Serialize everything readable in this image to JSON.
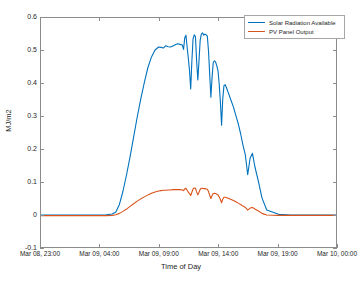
{
  "chart_data": {
    "type": "line",
    "title": "",
    "xlabel": "Time of Day",
    "ylabel": "MJ/m2",
    "grid": false,
    "legend_position": "top-right-inside",
    "ylim": [
      -0.1,
      0.6
    ],
    "yticks": [
      "0.6",
      "0.5",
      "0.4",
      "0.3",
      "0.2",
      "0.1",
      "0",
      "-0.1"
    ],
    "ytick_values": [
      0.6,
      0.5,
      0.4,
      0.3,
      0.2,
      0.1,
      0,
      -0.1
    ],
    "xlim_labels": [
      "Mar 08, 23:00",
      "Mar 10, 00:00"
    ],
    "xticks": [
      "Mar 08, 23:00",
      "Mar 09, 04:00",
      "Mar 09, 09:00",
      "Mar 09, 14:00",
      "Mar 09, 19:00",
      "Mar 10, 00:00"
    ],
    "xtick_hours": [
      0,
      5,
      10,
      15,
      20,
      25
    ],
    "x_hours_range": [
      0,
      25
    ],
    "series": [
      {
        "name": "Solar Radiation Available",
        "color": "#0072BD",
        "x_hours": [
          0,
          1,
          2,
          3,
          4,
          5,
          5.5,
          6,
          6.3,
          6.6,
          6.9,
          7.2,
          7.5,
          7.8,
          8.1,
          8.4,
          8.7,
          9.0,
          9.3,
          9.6,
          9.9,
          10.1,
          10.3,
          10.5,
          10.7,
          10.9,
          11.1,
          11.3,
          11.5,
          11.7,
          11.9,
          12.0,
          12.1,
          12.2,
          12.3,
          12.4,
          12.5,
          12.6,
          12.7,
          12.8,
          12.9,
          13.0,
          13.1,
          13.2,
          13.3,
          13.4,
          13.5,
          13.6,
          13.7,
          13.8,
          13.9,
          14.0,
          14.1,
          14.2,
          14.3,
          14.4,
          14.5,
          14.6,
          14.7,
          14.8,
          14.9,
          15.0,
          15.1,
          15.2,
          15.3,
          15.4,
          15.5,
          15.6,
          15.8,
          16.0,
          16.2,
          16.4,
          16.6,
          16.8,
          17.0,
          17.2,
          17.4,
          17.6,
          17.8,
          18.0,
          18.3,
          18.6,
          19.0,
          20.0,
          21.0,
          22.0,
          23.0,
          24.0,
          25.0
        ],
        "y_values": [
          0.003,
          0.003,
          0.003,
          0.003,
          0.003,
          0.003,
          0.004,
          0.006,
          0.012,
          0.035,
          0.075,
          0.125,
          0.18,
          0.24,
          0.3,
          0.355,
          0.405,
          0.45,
          0.482,
          0.503,
          0.512,
          0.511,
          0.509,
          0.516,
          0.513,
          0.512,
          0.515,
          0.519,
          0.522,
          0.52,
          0.518,
          0.505,
          0.54,
          0.548,
          0.512,
          0.478,
          0.441,
          0.385,
          0.47,
          0.537,
          0.549,
          0.544,
          0.47,
          0.412,
          0.47,
          0.533,
          0.552,
          0.555,
          0.548,
          0.551,
          0.549,
          0.545,
          0.5,
          0.43,
          0.36,
          0.42,
          0.465,
          0.47,
          0.466,
          0.455,
          0.44,
          0.4,
          0.345,
          0.275,
          0.355,
          0.395,
          0.398,
          0.39,
          0.37,
          0.35,
          0.33,
          0.305,
          0.28,
          0.25,
          0.215,
          0.185,
          0.125,
          0.175,
          0.19,
          0.15,
          0.105,
          0.055,
          0.018,
          0.005,
          0.003,
          0.003,
          0.003,
          0.003,
          0.003,
          0.003
        ]
      },
      {
        "name": "PV Panel Output",
        "color": "#D95319",
        "x_hours": [
          0,
          1,
          2,
          3,
          4,
          5,
          5.5,
          6,
          6.3,
          6.6,
          6.9,
          7.2,
          7.5,
          7.8,
          8.1,
          8.4,
          8.7,
          9.0,
          9.3,
          9.6,
          9.9,
          10.1,
          10.3,
          10.5,
          10.7,
          10.9,
          11.1,
          11.3,
          11.5,
          11.7,
          11.9,
          12.0,
          12.1,
          12.2,
          12.3,
          12.4,
          12.5,
          12.6,
          12.7,
          12.8,
          12.9,
          13.0,
          13.1,
          13.2,
          13.3,
          13.4,
          13.5,
          13.6,
          13.7,
          13.8,
          13.9,
          14.0,
          14.1,
          14.2,
          14.3,
          14.4,
          14.5,
          14.6,
          14.7,
          14.8,
          14.9,
          15.0,
          15.1,
          15.2,
          15.3,
          15.4,
          15.5,
          15.6,
          15.8,
          16.0,
          16.2,
          16.4,
          16.6,
          16.8,
          17.0,
          17.2,
          17.4,
          17.6,
          17.8,
          18.0,
          18.3,
          18.6,
          19.0,
          20.0,
          21.0,
          22.0,
          23.0,
          24.0,
          25.0
        ],
        "y_values": [
          0.001,
          0.001,
          0.001,
          0.001,
          0.001,
          0.001,
          0.001,
          0.002,
          0.004,
          0.008,
          0.014,
          0.021,
          0.029,
          0.037,
          0.045,
          0.052,
          0.058,
          0.064,
          0.069,
          0.073,
          0.076,
          0.077,
          0.078,
          0.078,
          0.079,
          0.079,
          0.08,
          0.08,
          0.08,
          0.08,
          0.079,
          0.077,
          0.082,
          0.084,
          0.078,
          0.072,
          0.068,
          0.062,
          0.072,
          0.082,
          0.085,
          0.084,
          0.073,
          0.064,
          0.072,
          0.081,
          0.084,
          0.084,
          0.083,
          0.083,
          0.082,
          0.081,
          0.074,
          0.063,
          0.053,
          0.062,
          0.068,
          0.069,
          0.068,
          0.066,
          0.064,
          0.058,
          0.05,
          0.04,
          0.051,
          0.057,
          0.057,
          0.056,
          0.053,
          0.05,
          0.047,
          0.043,
          0.039,
          0.035,
          0.03,
          0.026,
          0.018,
          0.024,
          0.026,
          0.021,
          0.015,
          0.008,
          0.003,
          0.002,
          0.002,
          0.002,
          0.002,
          0.002,
          0.002,
          0.002
        ]
      }
    ]
  },
  "legend": {
    "entries": [
      {
        "label": "Solar Radiation Available"
      },
      {
        "label": "PV Panel Output"
      }
    ]
  }
}
